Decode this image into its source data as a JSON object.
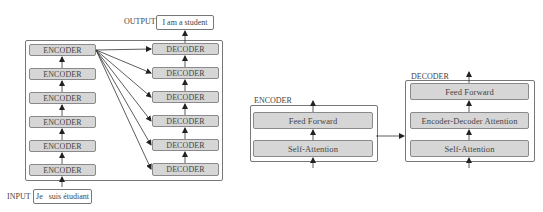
{
  "left_diagram": {
    "output_label": "OUTPUT",
    "output_text": "I am a student",
    "input_label": "INPUT",
    "input_text": "Je   suis étudiant",
    "encoders": [
      "ENCODER",
      "ENCODER",
      "ENCODER",
      "ENCODER",
      "ENCODER",
      "ENCODER"
    ],
    "decoders": [
      "DECODER",
      "DECODER",
      "DECODER",
      "DECODER",
      "DECODER",
      "DECODER"
    ]
  },
  "encoder_detail": {
    "title": "ENCODER",
    "layers": [
      "Feed Forward",
      "Self-Attention"
    ]
  },
  "decoder_detail": {
    "title": "DECODER",
    "layers": [
      "Feed Forward",
      "Encoder-Decoder Attention",
      "Self-Attention"
    ]
  },
  "colors": {
    "block_fill": "#d6d6d6",
    "block_border": "#8a8a8a",
    "arrow": "#333333"
  }
}
